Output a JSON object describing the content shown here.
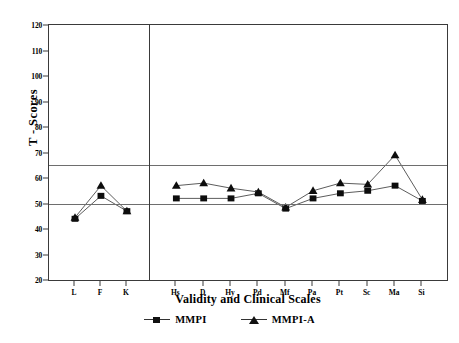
{
  "chart_data": {
    "type": "line",
    "title": "",
    "xlabel": "Validity and Clinical Scales",
    "ylabel": "T - Scores",
    "categories": [
      "L",
      "F",
      "K",
      "Hs",
      "D",
      "Hy",
      "Pd",
      "Mf",
      "Pa",
      "Pt",
      "Sc",
      "Ma",
      "Si"
    ],
    "ylim": [
      20,
      120
    ],
    "yticks": [
      20,
      30,
      40,
      50,
      60,
      70,
      80,
      90,
      100,
      110,
      120
    ],
    "grid": false,
    "reference_lines": [
      50,
      65
    ],
    "panel_divider_after": "K",
    "legend_position": "bottom",
    "series": [
      {
        "name": "MMPI",
        "marker": "square",
        "values": [
          44,
          53,
          47,
          52,
          52,
          52,
          54,
          48,
          52,
          54,
          55,
          57,
          51
        ]
      },
      {
        "name": "MMPI-A",
        "marker": "triangle",
        "values": [
          44.5,
          57,
          47,
          57,
          58,
          56,
          54.5,
          48.5,
          55,
          58,
          57.5,
          69,
          51.5
        ]
      }
    ]
  },
  "legend": {
    "items": [
      {
        "label": "MMPI",
        "marker": "square-marker"
      },
      {
        "label": "MMPI-A",
        "marker": "triangle-marker"
      }
    ]
  }
}
